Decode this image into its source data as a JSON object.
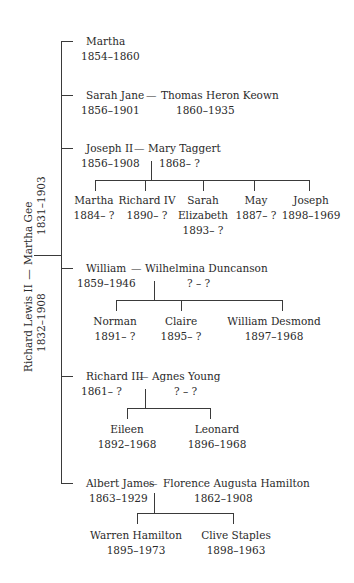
{
  "root": {
    "person": {
      "name": "Richard Lewis II",
      "dates": "1832–1908"
    },
    "spouse": {
      "name": "Martha Gee",
      "dates": "1831–1903"
    },
    "connector": "—"
  },
  "children": [
    {
      "name": "Martha",
      "dates": "1854–1860"
    },
    {
      "name": "Sarah Jane",
      "dates": "1856–1901",
      "spouse": {
        "name": "Thomas Heron Keown",
        "dates": "1860–1935"
      }
    },
    {
      "name": "Joseph II",
      "dates": "1856–1908",
      "spouse": {
        "name": "Mary Taggert",
        "dates": "1868– ?"
      },
      "children": [
        {
          "name": "Martha",
          "dates": "1884– ?"
        },
        {
          "name": "Richard IV",
          "dates": "1890– ?"
        },
        {
          "name": "Sarah",
          "name2": "Elizabeth",
          "dates": "1893– ?"
        },
        {
          "name": "May",
          "dates": "1887– ?"
        },
        {
          "name": "Joseph",
          "dates": "1898–1969"
        }
      ]
    },
    {
      "name": "William",
      "dates": "1859–1946",
      "spouse": {
        "name": "Wilhelmina Duncanson",
        "dates": "? – ?"
      },
      "children": [
        {
          "name": "Norman",
          "dates": "1891– ?"
        },
        {
          "name": "Claire",
          "dates": "1895– ?"
        },
        {
          "name": "William Desmond",
          "dates": "1897–1968"
        }
      ]
    },
    {
      "name": "Richard III",
      "dates": "1861– ?",
      "spouse": {
        "name": "Agnes Young",
        "dates": "? – ?"
      },
      "children": [
        {
          "name": "Eileen",
          "dates": "1892–1968"
        },
        {
          "name": "Leonard",
          "dates": "1896–1968"
        }
      ]
    },
    {
      "name": "Albert James",
      "dates": "1863–1929",
      "spouse": {
        "name": "Florence Augusta Hamilton",
        "dates": "1862–1908"
      },
      "children": [
        {
          "name": "Warren Hamilton",
          "dates": "1895–1973"
        },
        {
          "name": "Clive Staples",
          "dates": "1898–1963"
        }
      ]
    }
  ]
}
